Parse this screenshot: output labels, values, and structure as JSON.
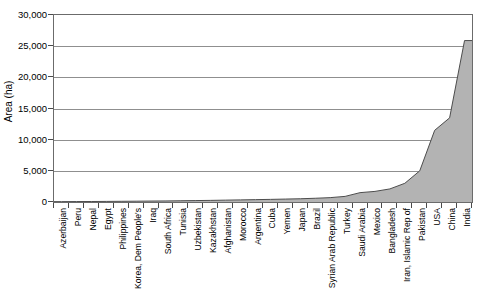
{
  "chart_data": {
    "type": "area",
    "title": "",
    "xlabel": "",
    "ylabel": "Area (ha)",
    "ylim": [
      0,
      30000
    ],
    "ytick_labels": [
      "0",
      "5,000",
      "10,000",
      "15,000",
      "20,000",
      "25,000",
      "30,000"
    ],
    "ytick_values": [
      0,
      5000,
      10000,
      15000,
      20000,
      25000,
      30000
    ],
    "grid": true,
    "legend": "none",
    "series_name": "Area (ha)",
    "fill_color": "#b3b3b3",
    "line_color": "#4d4d4d",
    "axis_color": "#6b6b6b",
    "gridline_color": "#8f8f8f",
    "categories": [
      "Azerbaijan",
      "Peru",
      "Nepal",
      "Egypt",
      "Philippines",
      "Korea, Dem People's",
      "Iraq",
      "South Africa",
      "Tunisia",
      "Uzbekistan",
      "Kazakhstan",
      "Afghanistan",
      "Morocco",
      "Argentina",
      "Cuba",
      "Yemen",
      "Japan",
      "Brazil",
      "Syrian Arab Republic",
      "Turkey",
      "Saudi Arabia",
      "Mexico",
      "Bangladesh",
      "Iran, Islamic Rep of",
      "Pakistan",
      "USA",
      "China",
      "India"
    ],
    "values": [
      60,
      70,
      80,
      95,
      110,
      130,
      150,
      170,
      200,
      230,
      260,
      300,
      340,
      380,
      420,
      470,
      520,
      600,
      700,
      900,
      1500,
      1700,
      2100,
      3000,
      5000,
      11500,
      13500,
      25900
    ]
  }
}
